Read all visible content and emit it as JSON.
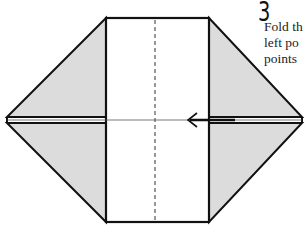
{
  "step": {
    "number": "3",
    "instruction_lines": [
      "Fold th",
      "left   po",
      "points"
    ]
  },
  "diagram": {
    "fill_color": "#dcdcdc",
    "stroke_color": "#111111",
    "elements": [
      "central-rectangle",
      "center-dashed-crease",
      "left-upper-flap",
      "left-lower-flap",
      "right-upper-flap",
      "right-lower-flap",
      "fold-arrow-left"
    ]
  }
}
